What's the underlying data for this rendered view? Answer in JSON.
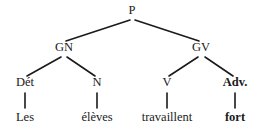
{
  "figure": {
    "kind": "constituency-syntax-tree",
    "language": "French",
    "sentence": "Les élèves travaillent fort",
    "background_color": "#ffffff",
    "line_color": "#1a1a1a",
    "text_color": "#1a1a1a"
  },
  "nodes": {
    "root": {
      "label": "P",
      "x": 132,
      "level": "root"
    },
    "gn": {
      "label": "GN",
      "x": 64,
      "level": "phrase"
    },
    "gv": {
      "label": "GV",
      "x": 201,
      "level": "phrase"
    },
    "det": {
      "label": "Dét",
      "x": 25,
      "level": "category",
      "bold": false
    },
    "n": {
      "label": "N",
      "x": 97,
      "level": "category",
      "bold": false
    },
    "v": {
      "label": "V",
      "x": 167,
      "level": "category",
      "bold": false
    },
    "adv": {
      "label": "Adv.",
      "x": 235,
      "level": "category",
      "bold": true
    },
    "w_det": {
      "label": "Les",
      "x": 25,
      "level": "word",
      "bold": false
    },
    "w_n": {
      "label": "élèves",
      "x": 97,
      "level": "word",
      "bold": false
    },
    "w_v": {
      "label": "travaillent",
      "x": 167,
      "level": "word",
      "bold": false
    },
    "w_adv": {
      "label": "fort",
      "x": 235,
      "level": "word",
      "bold": true
    }
  },
  "edges": [
    {
      "name": "p-to-gn",
      "x1": 130,
      "y1": 20,
      "x2": 66,
      "y2": 41
    },
    {
      "name": "p-to-gv",
      "x1": 135,
      "y1": 20,
      "x2": 199,
      "y2": 41
    },
    {
      "name": "gn-to-det",
      "x1": 61,
      "y1": 57,
      "x2": 27,
      "y2": 76
    },
    {
      "name": "gn-to-n",
      "x1": 67,
      "y1": 57,
      "x2": 95,
      "y2": 76
    },
    {
      "name": "gv-to-v",
      "x1": 198,
      "y1": 57,
      "x2": 169,
      "y2": 76
    },
    {
      "name": "gv-to-adv",
      "x1": 205,
      "y1": 57,
      "x2": 233,
      "y2": 76
    },
    {
      "name": "det-to-les",
      "x1": 25,
      "y1": 93,
      "x2": 25,
      "y2": 108
    },
    {
      "name": "n-to-eleves",
      "x1": 97,
      "y1": 93,
      "x2": 97,
      "y2": 108
    },
    {
      "name": "v-to-travaillent",
      "x1": 167,
      "y1": 93,
      "x2": 167,
      "y2": 108
    },
    {
      "name": "adv-to-fort",
      "x1": 235,
      "y1": 93,
      "x2": 235,
      "y2": 108
    }
  ]
}
